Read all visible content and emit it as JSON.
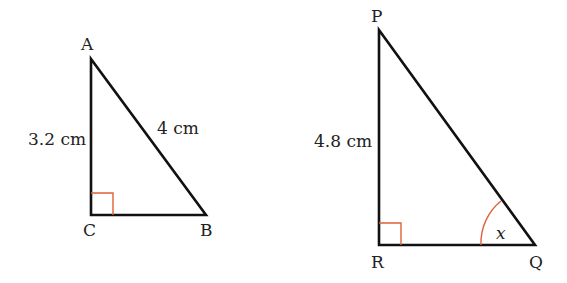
{
  "triangle_1": {
    "vertices": {
      "top": "A",
      "right_angle": "C",
      "right": "B"
    },
    "side_AC": "3.2 cm",
    "side_AB": "4 cm",
    "right_angle_at": "C"
  },
  "triangle_2": {
    "vertices": {
      "top": "P",
      "right_angle": "R",
      "right": "Q"
    },
    "side_PR": "4.8 cm",
    "angle_label": "x",
    "angle_at": "Q",
    "right_angle_at": "R"
  },
  "colors": {
    "lines": "#111111",
    "marker": "#e0603a"
  }
}
